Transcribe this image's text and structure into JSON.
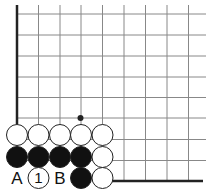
{
  "diagram": {
    "type": "go-board-corner",
    "colors": {
      "background": "#ffffff",
      "grid_line": "#888888",
      "edge_line": "#222222",
      "black_stone": "#111111",
      "white_stone": "#ffffff",
      "stone_outline": "#222222"
    },
    "grid": {
      "columns_x": [
        17,
        38.5,
        60,
        81,
        102.5,
        124,
        145.5,
        167,
        188.5
      ],
      "rows_y": [
        14,
        35,
        56,
        77,
        97.5,
        118,
        135,
        157,
        178
      ],
      "right_extent": 206,
      "left_edge": {
        "x": 17,
        "y_from": 5,
        "y_to": 124
      },
      "bottom_edge": {
        "y": 181,
        "x_from": 110,
        "x_to": 203
      }
    },
    "star_point": {
      "x": 80.5,
      "y": 118
    },
    "stones": [
      {
        "color": "white",
        "x": 17,
        "y": 135
      },
      {
        "color": "white",
        "x": 38.5,
        "y": 135
      },
      {
        "color": "white",
        "x": 60,
        "y": 135
      },
      {
        "color": "white",
        "x": 81,
        "y": 135
      },
      {
        "color": "white",
        "x": 102.5,
        "y": 135
      },
      {
        "color": "black",
        "x": 17,
        "y": 157
      },
      {
        "color": "black",
        "x": 38.5,
        "y": 157
      },
      {
        "color": "black",
        "x": 60,
        "y": 157
      },
      {
        "color": "black",
        "x": 81,
        "y": 157
      },
      {
        "color": "white",
        "x": 102.5,
        "y": 157
      },
      {
        "color": "white",
        "x": 38.5,
        "y": 178,
        "label": "1"
      },
      {
        "color": "black",
        "x": 81,
        "y": 178
      },
      {
        "color": "white",
        "x": 102.5,
        "y": 178
      }
    ],
    "labels": [
      {
        "text": "A",
        "x": 17,
        "y": 178
      },
      {
        "text": "B",
        "x": 60,
        "y": 178
      }
    ]
  }
}
